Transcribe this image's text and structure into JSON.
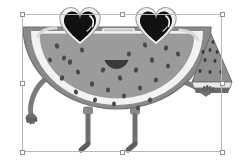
{
  "app": {
    "background_color": "#ffffff",
    "canvas": {
      "width": 242,
      "height": 165
    }
  },
  "selection": {
    "label": "selection-bounding-box",
    "x": 22,
    "y": 14,
    "width": 200,
    "height": 138,
    "border_color": "#b8b8bc",
    "handle_fill": "#ffffff",
    "handle_stroke": "#8d8d93",
    "handle_size": 5,
    "handles": [
      {
        "name": "handle-top-left",
        "cx": 22,
        "cy": 14
      },
      {
        "name": "handle-top-center",
        "cx": 122,
        "cy": 14
      },
      {
        "name": "handle-top-right",
        "cx": 222,
        "cy": 14
      },
      {
        "name": "handle-middle-left",
        "cx": 22,
        "cy": 83
      },
      {
        "name": "handle-middle-right",
        "cx": 222,
        "cy": 83
      },
      {
        "name": "handle-bottom-left",
        "cx": 22,
        "cy": 152
      },
      {
        "name": "handle-bottom-center",
        "cx": 122,
        "cy": 152
      },
      {
        "name": "handle-bottom-right",
        "cx": 222,
        "cy": 152
      }
    ]
  },
  "artwork": {
    "name": "watermelon-character",
    "description": "Grayscale cartoon half-slice watermelon character wearing heart-shaped sunglasses, smiling, with arms and legs, holding a small watermelon wedge in its right hand",
    "palette": {
      "flesh": "#9b9b9b",
      "flesh_shade": "#8c8c8c",
      "seed": "#4a4a4a",
      "rind_white": "#f2f2f2",
      "rind_outer": "#8a8a8a",
      "rind_outer_dark": "#6f6f6f",
      "limb": "#7b7b7b",
      "limb_dark": "#5e5e5e",
      "lens": "#111111",
      "lens_highlight": "#ffffff",
      "frame": "#e9e9e9",
      "frame_edge": "#9a9a9a",
      "mouth": "#3a3a3a",
      "wedge_flesh": "#8f8f8f",
      "wedge_rind": "#6a6a6a"
    },
    "parts": [
      {
        "name": "watermelon-body",
        "label": "Watermelon slice body"
      },
      {
        "name": "rind-white-band",
        "label": "White inner rind"
      },
      {
        "name": "rind-outer-band",
        "label": "Green outer rind"
      },
      {
        "name": "seeds",
        "label": "Seeds",
        "count": 26
      },
      {
        "name": "heart-sunglasses",
        "label": "Heart-shaped sunglasses"
      },
      {
        "name": "left-lens",
        "label": "Left heart lens"
      },
      {
        "name": "right-lens",
        "label": "Right heart lens"
      },
      {
        "name": "glasses-bridge",
        "label": "Sunglasses bridge"
      },
      {
        "name": "smile-mouth",
        "label": "Smiling mouth"
      },
      {
        "name": "left-arm",
        "label": "Left arm"
      },
      {
        "name": "left-hand",
        "label": "Left hand"
      },
      {
        "name": "right-arm",
        "label": "Right arm"
      },
      {
        "name": "right-hand",
        "label": "Right hand"
      },
      {
        "name": "held-watermelon-wedge",
        "label": "Small watermelon wedge"
      },
      {
        "name": "left-leg",
        "label": "Left leg"
      },
      {
        "name": "right-leg",
        "label": "Right leg"
      },
      {
        "name": "left-foot",
        "label": "Left foot"
      },
      {
        "name": "right-foot",
        "label": "Right foot"
      }
    ]
  }
}
